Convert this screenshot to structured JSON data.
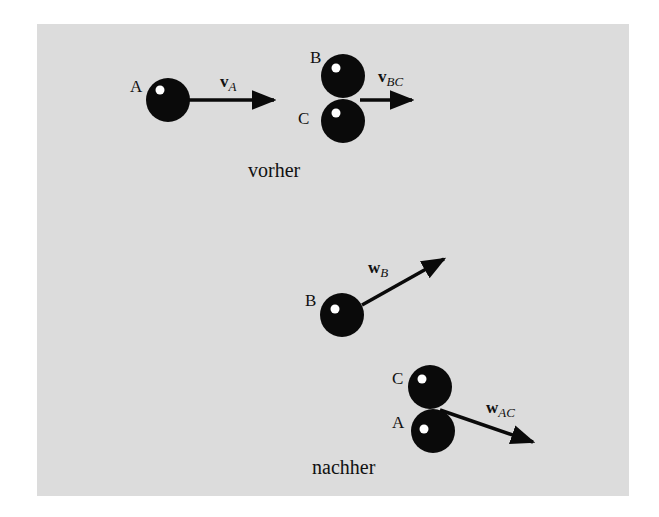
{
  "diagram": {
    "title_before": "vorher",
    "title_after": "nachher",
    "colors": {
      "background": "#dcdcdc",
      "ball": "#0a0a0a",
      "highlight": "#ffffff",
      "text": "#111111"
    },
    "before": {
      "balls": [
        {
          "label": "A",
          "cx": 168,
          "cy": 100
        },
        {
          "label": "B",
          "cx": 343,
          "cy": 76
        },
        {
          "label": "C",
          "cx": 343,
          "cy": 121
        }
      ],
      "arrows": [
        {
          "label": "v",
          "sub": "A",
          "from": [
            188,
            100
          ],
          "to": [
            276,
            100
          ]
        },
        {
          "label": "v",
          "sub": "BC",
          "from": [
            362,
            100
          ],
          "to": [
            414,
            100
          ]
        }
      ]
    },
    "after": {
      "balls": [
        {
          "label": "B",
          "cx": 342,
          "cy": 315
        },
        {
          "label": "C",
          "cx": 430,
          "cy": 387
        },
        {
          "label": "A",
          "cx": 433,
          "cy": 431
        }
      ],
      "arrows": [
        {
          "label": "w",
          "sub": "B",
          "from": [
            362,
            305
          ],
          "to": [
            446,
            258
          ]
        },
        {
          "label": "w",
          "sub": "AC",
          "from": [
            440,
            410
          ],
          "to": [
            535,
            443
          ]
        }
      ]
    }
  }
}
